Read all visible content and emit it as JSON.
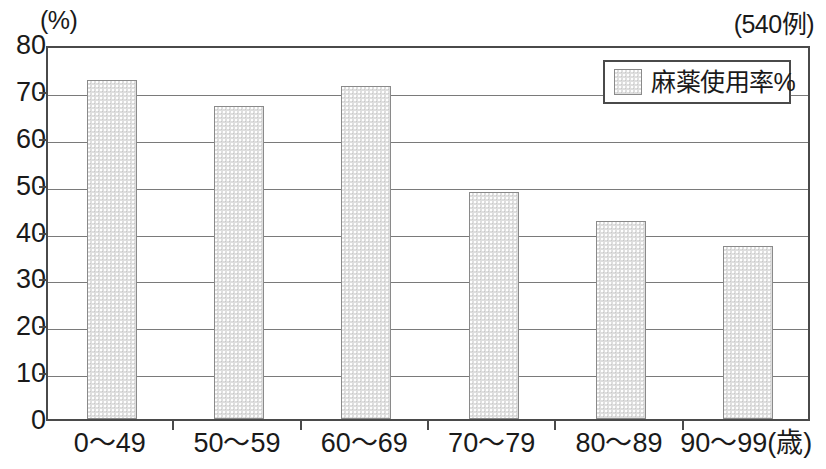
{
  "chart_data": {
    "type": "bar",
    "title": "",
    "subtitle": "",
    "unit_label": "(%)",
    "sample_label": "(540例)",
    "xlabel": "",
    "ylabel": "",
    "x_axis_unit": "(歳)",
    "categories": [
      "0～49",
      "50～59",
      "60～69",
      "70～79",
      "80～89",
      "90～99(歳)"
    ],
    "values": [
      72.4,
      66.8,
      71.1,
      48.5,
      42.2,
      36.9
    ],
    "series": [
      {
        "name": "麻薬使用率%",
        "values": [
          72.4,
          66.8,
          71.1,
          48.5,
          42.2,
          36.9
        ],
        "color": "#dedede"
      }
    ],
    "ylim": [
      0,
      80
    ],
    "ytick_step": 10,
    "ytick_labels": [
      "80",
      "70",
      "60",
      "50",
      "40",
      "30",
      "20",
      "10",
      "0"
    ],
    "ytick_values": [
      80,
      70,
      60,
      50,
      40,
      30,
      20,
      10,
      0
    ],
    "grid": true,
    "legend_position": "top-right",
    "legend_entries": [
      "麻薬使用率%"
    ]
  },
  "colors": {
    "bar_fill": "#dedede",
    "bar_border": "#8a8a8a",
    "axis": "#4a4a4a",
    "gridline": "#7a7a7a",
    "text": "#1a1a1a",
    "background": "#ffffff"
  }
}
